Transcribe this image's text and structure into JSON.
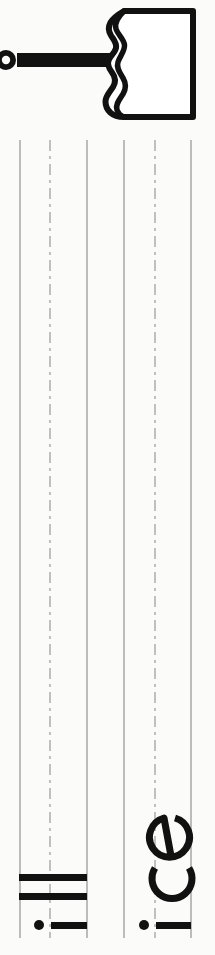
{
  "worksheet": {
    "type": "handwriting-practice",
    "orientation": "rotated-90-ccw",
    "target_word": "ice",
    "practice_letter": "i",
    "page_background": "#fbfbfa"
  },
  "illustration": {
    "name": "popsicle",
    "alt_text": "popsicle",
    "outline_color": "#111111",
    "fill_color": "#ffffff",
    "stick_color": "#111111"
  },
  "rules": {
    "line_color_solid": "#bcbcbc",
    "line_color_dashed": "#c0c0c0",
    "count": 6,
    "lines": [
      {
        "id": "line-1",
        "style": "solid",
        "x": 19
      },
      {
        "id": "line-2",
        "style": "dashdot",
        "x": 51
      },
      {
        "id": "line-3",
        "style": "solid",
        "x": 86
      },
      {
        "id": "line-4",
        "style": "solid",
        "x": 123
      },
      {
        "id": "line-5",
        "style": "dashdot",
        "x": 156
      },
      {
        "id": "line-6",
        "style": "solid",
        "x": 190
      }
    ]
  },
  "written": {
    "ink_color": "#111111",
    "group_left": {
      "label": "iii",
      "description": "three practice strokes of the letter i"
    },
    "group_right": {
      "label": "ice",
      "description": "the word ice written in lowercase"
    }
  }
}
